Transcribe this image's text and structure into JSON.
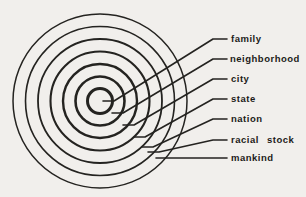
{
  "figure": {
    "background": "#f1efec",
    "ink": "#242320",
    "center": {
      "x": 100,
      "y": 101
    },
    "circles": [
      {
        "r": 12.5,
        "w": 3.0
      },
      {
        "r": 24.5,
        "w": 2.6
      },
      {
        "r": 37.0,
        "w": 2.4
      },
      {
        "r": 49.5,
        "w": 2.1
      },
      {
        "r": 62.0,
        "w": 1.8
      },
      {
        "r": 74.5,
        "w": 1.6
      },
      {
        "r": 87.0,
        "w": 1.5
      }
    ],
    "leader_width": 1.6,
    "labels": [
      {
        "id": "family",
        "text": "family",
        "x": 231,
        "y": 39,
        "leader": [
          [
            103,
            101
          ],
          [
            114,
            101
          ],
          [
            213,
            39
          ],
          [
            227,
            39
          ]
        ]
      },
      {
        "id": "neighborhood",
        "text": "neighborhood",
        "x": 230,
        "y": 59,
        "leader": [
          [
            112,
            113
          ],
          [
            123,
            113
          ],
          [
            213,
            59
          ],
          [
            227,
            59
          ]
        ]
      },
      {
        "id": "city",
        "text": "city",
        "x": 231,
        "y": 79,
        "leader": [
          [
            123,
            125
          ],
          [
            134,
            125
          ],
          [
            213,
            79
          ],
          [
            227,
            79
          ]
        ]
      },
      {
        "id": "state",
        "text": "state",
        "x": 231,
        "y": 99,
        "leader": [
          [
            134,
            137
          ],
          [
            145,
            137
          ],
          [
            213,
            99
          ],
          [
            227,
            99
          ]
        ]
      },
      {
        "id": "nation",
        "text": "nation",
        "x": 231,
        "y": 119,
        "leader": [
          [
            142,
            147
          ],
          [
            153,
            147
          ],
          [
            213,
            119
          ],
          [
            227,
            119
          ]
        ]
      },
      {
        "id": "racial-stock",
        "text": "racial stock",
        "x": 231,
        "y": 140,
        "leader": [
          [
            148,
            152
          ],
          [
            159,
            152
          ],
          [
            213,
            140
          ],
          [
            227,
            140
          ]
        ]
      },
      {
        "id": "mankind",
        "text": "mankind",
        "x": 231,
        "y": 158,
        "leader": [
          [
            156,
            158
          ],
          [
            227,
            158
          ]
        ]
      }
    ]
  }
}
